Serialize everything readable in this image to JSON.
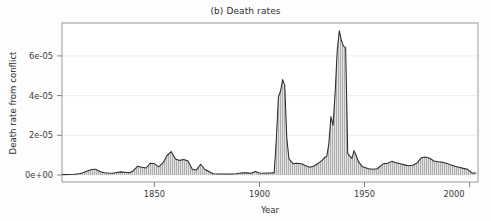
{
  "figure": {
    "title": "(b) Death rates",
    "background_color": "#fdfdfd"
  },
  "chart_data": {
    "type": "area",
    "title": "(b) Death rates",
    "xlabel": "Year",
    "ylabel": "Death rate from conflict",
    "xlim": [
      1812,
      2010
    ],
    "ylim": [
      0,
      7.8e-05
    ],
    "xticks": [
      1850,
      1900,
      1950,
      2000
    ],
    "xtick_labels": [
      "1850",
      "1900",
      "1950",
      "2000"
    ],
    "yticks": [
      0,
      2e-05,
      4e-05,
      6e-05
    ],
    "ytick_labels": [
      "0e+00",
      "2e-05",
      "4e-05",
      "6e-05"
    ],
    "grid": true,
    "grid_axis": "y",
    "legend": null,
    "line_color": "#2b2b2b",
    "fill_color": "#d8d8d8",
    "hatch": "vertical-lines",
    "series": [
      {
        "name": "Death rate from conflict",
        "x": [
          1812,
          1815,
          1818,
          1820,
          1822,
          1824,
          1826,
          1828,
          1830,
          1832,
          1834,
          1836,
          1838,
          1840,
          1842,
          1844,
          1846,
          1848,
          1850,
          1852,
          1854,
          1856,
          1858,
          1860,
          1862,
          1864,
          1866,
          1868,
          1870,
          1872,
          1874,
          1876,
          1878,
          1880,
          1884,
          1888,
          1892,
          1895,
          1898,
          1900,
          1902,
          1904,
          1906,
          1908,
          1910,
          1912,
          1913,
          1914,
          1915,
          1916,
          1917,
          1918,
          1919,
          1920,
          1921,
          1922,
          1924,
          1926,
          1928,
          1930,
          1932,
          1934,
          1936,
          1937,
          1938,
          1939,
          1940,
          1941,
          1942,
          1943,
          1944,
          1945,
          1946,
          1947,
          1948,
          1950,
          1951,
          1952,
          1953,
          1955,
          1958,
          1960,
          1962,
          1965,
          1967,
          1969,
          1971,
          1973,
          1975,
          1977,
          1979,
          1981,
          1983,
          1985,
          1987,
          1989,
          1991,
          1993,
          1995,
          1997,
          1999,
          2001,
          2003,
          2005,
          2007,
          2009
        ],
        "y": [
          2e-07,
          3e-07,
          4e-07,
          6e-07,
          1.2e-06,
          2e-06,
          2.8e-06,
          3e-06,
          1.8e-06,
          1.2e-06,
          1e-06,
          9e-07,
          1.3e-06,
          1.6e-06,
          1.4e-06,
          1.2e-06,
          2.2e-06,
          4.5e-06,
          4e-06,
          3.6e-06,
          6e-06,
          5.8e-06,
          4.2e-06,
          6.2e-06,
          1e-05,
          1.2e-05,
          8.2e-06,
          7.5e-06,
          8e-06,
          7.2e-06,
          3e-06,
          2.6e-06,
          5.5e-06,
          2.8e-06,
          6e-07,
          5e-07,
          5e-07,
          6e-07,
          1.2e-06,
          1.1e-06,
          9e-07,
          1.8e-06,
          1e-06,
          9e-07,
          1e-06,
          1.1e-06,
          1.2e-06,
          1.8e-05,
          4e-05,
          4.3e-05,
          4.9e-05,
          4.6e-05,
          1.9e-05,
          8.5e-06,
          7e-06,
          5.8e-06,
          6e-06,
          5.8e-06,
          4.8e-06,
          4e-06,
          4.6e-06,
          6e-06,
          7.8e-06,
          9e-06,
          9.5e-06,
          1.6e-05,
          3e-05,
          2.55e-05,
          4.2e-05,
          6.4e-05,
          7.4e-05,
          6.9e-05,
          6.6e-05,
          6.55e-05,
          1.1e-05,
          8.5e-06,
          1.25e-05,
          1e-05,
          7e-06,
          4.2e-06,
          3.2e-06,
          3e-06,
          3.2e-06,
          5.8e-06,
          6e-06,
          7e-06,
          6.3e-06,
          5.8e-06,
          5.2e-06,
          4.8e-06,
          5e-06,
          6.2e-06,
          8.8e-06,
          9.2e-06,
          8.6e-06,
          7.2e-06,
          6.8e-06,
          6.6e-06,
          6e-06,
          5.2e-06,
          4.5e-06,
          4e-06,
          3.4e-06,
          3e-06,
          1.1e-06,
          1e-06
        ]
      }
    ]
  },
  "plot_geometry": {
    "left": 62,
    "right": 478,
    "top": 23,
    "bottom": 182,
    "baseline_y": 175
  }
}
